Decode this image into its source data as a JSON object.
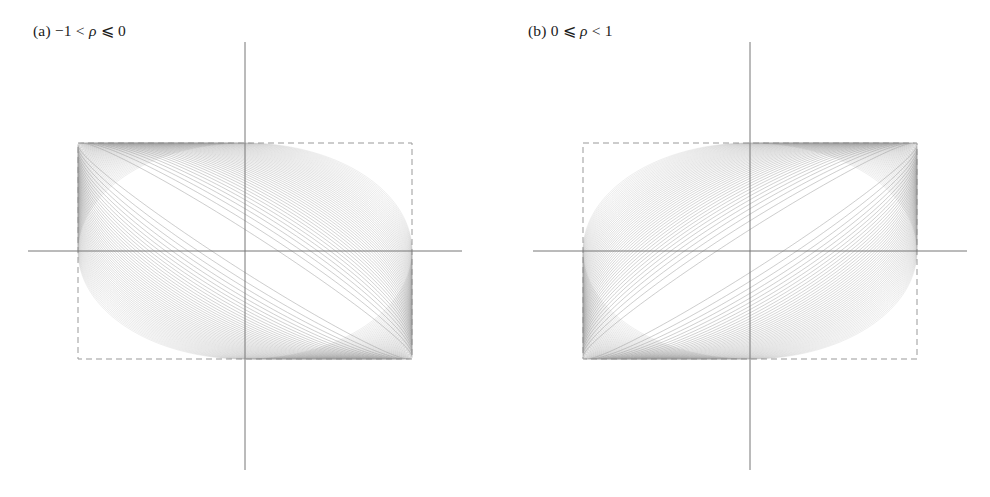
{
  "figure": {
    "background_color": "#ffffff",
    "width": 990,
    "height": 497
  },
  "panels": [
    {
      "id": "a",
      "caption_prefix": "(a)",
      "caption_full": "(a) −1 < ρ ⩽ 0",
      "caption_left": "−1 <",
      "caption_symbol": "ρ",
      "caption_right": "⩽ 0",
      "rho_min": -1,
      "rho_max": 0,
      "degenerate_diagonal": "anti-diagonal"
    },
    {
      "id": "b",
      "caption_prefix": "(b)",
      "caption_full": "(b) 0 ⩽ ρ < 1",
      "caption_left": "0 ⩽",
      "caption_symbol": "ρ",
      "caption_right": "< 1",
      "rho_min": 0,
      "rho_max": 1,
      "degenerate_diagonal": "main-diagonal"
    }
  ],
  "chart_data": {
    "type": "line",
    "title": "",
    "subtitle": "",
    "xlabel": "",
    "ylabel": "",
    "grid": false,
    "legend": "none",
    "axes": {
      "x_axis_visible": true,
      "y_axis_visible": true,
      "xlim": [
        -1.35,
        1.35
      ],
      "ylim": [
        -1.35,
        1.35
      ],
      "ticks": [],
      "tick_labels": [],
      "axis_color": "#777777",
      "axis_line_width": 1
    },
    "bounding_box": {
      "style": "dashed",
      "color": "#999999",
      "line_width": 1,
      "dash_pattern": "6 4",
      "x_half_width": 1.0,
      "y_half_height": 1.0
    },
    "series_style": {
      "color": "#8a8a8a",
      "line_width": 0.55,
      "opacity": 0.85,
      "ellipse_count": 60
    },
    "panel_a": {
      "rho_values": [
        0.0,
        -0.02,
        -0.04,
        -0.06,
        -0.08,
        -0.1,
        -0.12,
        -0.14,
        -0.16,
        -0.18,
        -0.2,
        -0.22,
        -0.24,
        -0.26,
        -0.28,
        -0.3,
        -0.32,
        -0.34,
        -0.36,
        -0.38,
        -0.4,
        -0.42,
        -0.44,
        -0.46,
        -0.48,
        -0.5,
        -0.52,
        -0.54,
        -0.56,
        -0.58,
        -0.6,
        -0.62,
        -0.64,
        -0.66,
        -0.68,
        -0.7,
        -0.72,
        -0.74,
        -0.76,
        -0.78,
        -0.8,
        -0.82,
        -0.84,
        -0.86,
        -0.88,
        -0.9,
        -0.92,
        -0.94,
        -0.96,
        -0.98
      ],
      "limit_line": "from top-left corner to bottom-right corner"
    },
    "panel_b": {
      "rho_values": [
        0.0,
        0.02,
        0.04,
        0.06,
        0.08,
        0.1,
        0.12,
        0.14,
        0.16,
        0.18,
        0.2,
        0.22,
        0.24,
        0.26,
        0.28,
        0.3,
        0.32,
        0.34,
        0.36,
        0.38,
        0.4,
        0.42,
        0.44,
        0.46,
        0.48,
        0.5,
        0.52,
        0.54,
        0.56,
        0.58,
        0.6,
        0.62,
        0.64,
        0.66,
        0.68,
        0.7,
        0.72,
        0.74,
        0.76,
        0.78,
        0.8,
        0.82,
        0.84,
        0.86,
        0.88,
        0.9,
        0.92,
        0.94,
        0.96,
        0.98
      ],
      "limit_line": "from bottom-left corner to top-right corner"
    }
  }
}
